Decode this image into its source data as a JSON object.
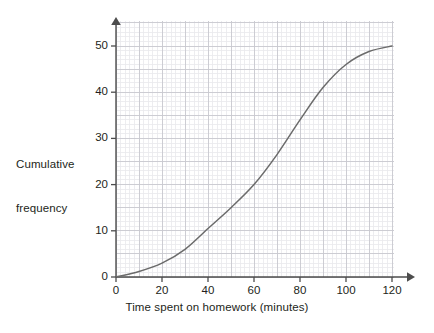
{
  "chart_data": {
    "type": "line",
    "title": "",
    "subtitle": "",
    "xlabel": "Time spent on homework (minutes)",
    "ylabel": "Cumulative frequency",
    "xlim": [
      0,
      120
    ],
    "ylim": [
      0,
      50
    ],
    "xticks": [
      0,
      20,
      40,
      60,
      80,
      100,
      120
    ],
    "yticks": [
      0,
      10,
      20,
      30,
      40,
      50
    ],
    "xtick_labels": [
      "0",
      "20",
      "40",
      "60",
      "80",
      "100",
      "120"
    ],
    "ytick_labels": [
      "0",
      "10",
      "20",
      "30",
      "40",
      "50"
    ],
    "grid": true,
    "grid_minor": true,
    "grid_major_step_x": 10,
    "grid_major_step_y": 5,
    "grid_minor_step_x": 2,
    "grid_minor_step_y": 1,
    "legend": null,
    "legend_position": "none",
    "annotations": [],
    "series": [
      {
        "name": "Cumulative frequency",
        "color": "#6b6b6b",
        "line_width": 1.5,
        "marker": "none",
        "x": [
          0,
          10,
          20,
          30,
          40,
          50,
          60,
          70,
          80,
          90,
          100,
          110,
          120
        ],
        "y": [
          0,
          1.2,
          3.0,
          6.0,
          10.5,
          15.0,
          20.0,
          26.5,
          34.0,
          41.0,
          46.0,
          48.8,
          50.0
        ]
      }
    ]
  },
  "axes": {
    "x_axis_color": "#4d4d4d",
    "y_axis_color": "#4d4d4d",
    "arrowheads": true,
    "grid_minor_color": "#e9e9ec",
    "grid_major_color": "#c9c9cf"
  },
  "labels": {
    "y_title_line1": "Cumulative",
    "y_title_line2": "frequency",
    "x_title": "Time spent on homework (minutes)"
  }
}
